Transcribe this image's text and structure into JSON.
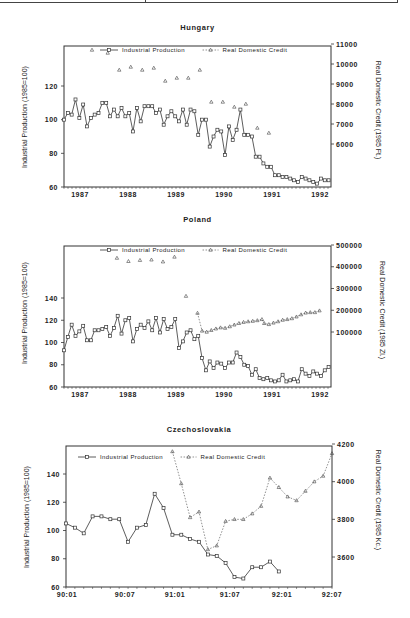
{
  "chart_data": [
    {
      "type": "line",
      "title": "Hungary",
      "xlabel": "",
      "ylabel": "Industrial Production (1985=100)",
      "ylabel_right": "Real Domestic Credit (1985 Ft.)",
      "x_ticks": [
        "1987",
        "1988",
        "1989",
        "1990",
        "1991",
        "1992"
      ],
      "y_ticks_left": [
        60,
        80,
        100,
        120
      ],
      "y_ticks_right": [
        6000,
        7000,
        8000,
        9000,
        10000,
        11000
      ],
      "ylim_left": [
        60,
        140
      ],
      "ylim_right": [
        4000,
        11000
      ],
      "legend": [
        "Industrial Production",
        "Real Domestic Credit"
      ],
      "x_range": [
        1986.8,
        1992.6
      ],
      "series": [
        {
          "name": "Industrial Production",
          "axis": "left",
          "style": "solid-square",
          "start": 1986.8,
          "step": 0.0833,
          "values": [
            100,
            104,
            103,
            112,
            101,
            109,
            96,
            101,
            103,
            104,
            110,
            110,
            102,
            106,
            102,
            107,
            102,
            104,
            93,
            107,
            99,
            108,
            108,
            108,
            104,
            106,
            97,
            102,
            105,
            102,
            99,
            106,
            97,
            106,
            105,
            91,
            100,
            100,
            84,
            90,
            94,
            93,
            79,
            96,
            88,
            94,
            106,
            91,
            91,
            90,
            78,
            78,
            74,
            72,
            72,
            67,
            67,
            66,
            66,
            65,
            64,
            63,
            66,
            65,
            64,
            63,
            62,
            65,
            64,
            64,
            63,
            67,
            67,
            64,
            66
          ]
        },
        {
          "name": "Real Domestic Credit",
          "axis": "right",
          "style": "scatter-triangle",
          "points": [
            [
              1987.75,
              10550
            ],
            [
              1988.0,
              9700
            ],
            [
              1988.25,
              9850
            ],
            [
              1988.5,
              9700
            ],
            [
              1988.75,
              9800
            ],
            [
              1989.0,
              9150
            ],
            [
              1989.25,
              9300
            ],
            [
              1989.5,
              9300
            ],
            [
              1989.75,
              9700
            ],
            [
              1990.0,
              8100
            ],
            [
              1990.25,
              8100
            ],
            [
              1990.5,
              7850
            ],
            [
              1990.75,
              8000
            ],
            [
              1991.0,
              6800
            ],
            [
              1991.25,
              6550
            ]
          ]
        }
      ]
    },
    {
      "type": "line",
      "title": "Poland",
      "xlabel": "",
      "ylabel": "Industrial Production (1985=100)",
      "ylabel_right": "Real Domestic Credit (1985 Zl.)",
      "x_ticks": [
        "1987",
        "1988",
        "1989",
        "1990",
        "1991",
        "1992"
      ],
      "y_ticks_left": [
        60,
        80,
        100,
        120,
        140
      ],
      "y_ticks_right": [
        100000,
        200000,
        300000,
        400000,
        500000
      ],
      "ylim_left": [
        60,
        185
      ],
      "ylim_right": [
        -150000,
        500000
      ],
      "legend": [
        "Industrial Production",
        "Real Domestic Credit"
      ],
      "x_range": [
        1986.8,
        1992.6
      ],
      "series": [
        {
          "name": "Industrial Production",
          "axis": "left",
          "style": "solid-square",
          "start": 1986.8,
          "step": 0.0833,
          "values": [
            93,
            105,
            116,
            106,
            110,
            115,
            102,
            102,
            111,
            111,
            112,
            114,
            106,
            113,
            124,
            108,
            120,
            122,
            101,
            112,
            116,
            113,
            119,
            111,
            122,
            109,
            121,
            112,
            114,
            121,
            95,
            101,
            109,
            111,
            103,
            106,
            86,
            75,
            83,
            77,
            82,
            81,
            77,
            82,
            82,
            91,
            87,
            80,
            79,
            71,
            76,
            68,
            67,
            68,
            66,
            65,
            66,
            71,
            65,
            66,
            67,
            65,
            76,
            72,
            70,
            74,
            72,
            70,
            75,
            78,
            73,
            75
          ]
        },
        {
          "name": "Real Domestic Credit",
          "axis": "right",
          "style": "dashed-triangle",
          "points": [
            [
              1987.95,
              440000
            ],
            [
              1988.2,
              425000
            ],
            [
              1988.45,
              430000
            ],
            [
              1988.7,
              432000
            ],
            [
              1988.95,
              423000
            ],
            [
              1989.2,
              445000
            ],
            [
              1989.45,
              265000
            ],
            [
              1989.7,
              187000
            ],
            [
              1989.8,
              105000
            ],
            [
              1989.9,
              100000
            ],
            [
              1990.0,
              108000
            ],
            [
              1990.1,
              115000
            ],
            [
              1990.2,
              120000
            ],
            [
              1990.3,
              118000
            ],
            [
              1990.4,
              125000
            ],
            [
              1990.5,
              133000
            ],
            [
              1990.6,
              140000
            ],
            [
              1990.7,
              145000
            ],
            [
              1990.8,
              148000
            ],
            [
              1990.9,
              150000
            ],
            [
              1991.0,
              153000
            ],
            [
              1991.1,
              158000
            ],
            [
              1991.15,
              140000
            ],
            [
              1991.25,
              135000
            ],
            [
              1991.35,
              142000
            ],
            [
              1991.45,
              148000
            ],
            [
              1991.55,
              155000
            ],
            [
              1991.65,
              158000
            ],
            [
              1991.75,
              162000
            ],
            [
              1991.85,
              170000
            ],
            [
              1991.95,
              180000
            ],
            [
              1992.05,
              188000
            ],
            [
              1992.15,
              190000
            ],
            [
              1992.25,
              190000
            ],
            [
              1992.35,
              198000
            ]
          ]
        }
      ]
    },
    {
      "type": "line",
      "title": "Czechoslovakia",
      "xlabel": "",
      "ylabel": "Industrial Production (1985=100)",
      "ylabel_right": "Real Domestic Credit (1985 Kc.)",
      "x_ticks": [
        "90:01",
        "90:07",
        "91:01",
        "91:07",
        "92:01",
        "92:07"
      ],
      "y_ticks_left": [
        60,
        80,
        100,
        120,
        140
      ],
      "y_ticks_right": [
        3600,
        3800,
        4000,
        4200
      ],
      "ylim_left": [
        60,
        160
      ],
      "ylim_right": [
        3450,
        4200
      ],
      "legend": [
        "Industrial Production",
        "Real Domestic Credit"
      ],
      "series": [
        {
          "name": "Industrial Production",
          "axis": "left",
          "style": "solid-square",
          "start_index": 0,
          "values": [
            105,
            102,
            98,
            110,
            110,
            108,
            108,
            92,
            102,
            104,
            126,
            116,
            97,
            97,
            94,
            92,
            83,
            82,
            77,
            67,
            66,
            74,
            74,
            78,
            71
          ]
        },
        {
          "name": "Real Domestic Credit",
          "axis": "right",
          "style": "dashed-triangle",
          "start_index": 12,
          "values": [
            4160,
            3990,
            3810,
            3840,
            3640,
            3660,
            3790,
            3800,
            3800,
            3830,
            3870,
            4020,
            3970,
            3920,
            3900,
            3950,
            4000,
            4030,
            4150
          ]
        }
      ]
    }
  ]
}
